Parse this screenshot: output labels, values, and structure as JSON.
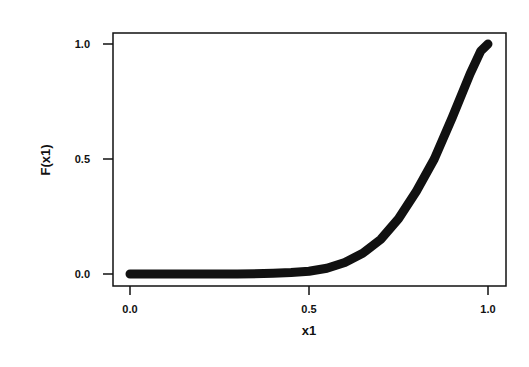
{
  "chart_data": {
    "type": "line",
    "title": "",
    "xlabel": "x1",
    "ylabel": "F(x1)",
    "xlim": [
      -0.05,
      1.05
    ],
    "ylim": [
      -0.05,
      1.05
    ],
    "xticks": [
      "0.0",
      "0.5",
      "1.0"
    ],
    "yticks": [
      "0.0",
      "0.5",
      "1.0"
    ],
    "grid": false,
    "legend": null,
    "series": [
      {
        "name": "F(x1)",
        "color": "#111111",
        "x": [
          0.0,
          0.1,
          0.2,
          0.3,
          0.4,
          0.45,
          0.5,
          0.55,
          0.6,
          0.65,
          0.7,
          0.75,
          0.8,
          0.85,
          0.9,
          0.95,
          0.98,
          1.0
        ],
        "y": [
          0.0,
          0.0,
          0.0,
          0.0,
          0.003,
          0.006,
          0.012,
          0.025,
          0.05,
          0.09,
          0.15,
          0.24,
          0.36,
          0.5,
          0.68,
          0.87,
          0.97,
          1.0
        ]
      }
    ]
  }
}
